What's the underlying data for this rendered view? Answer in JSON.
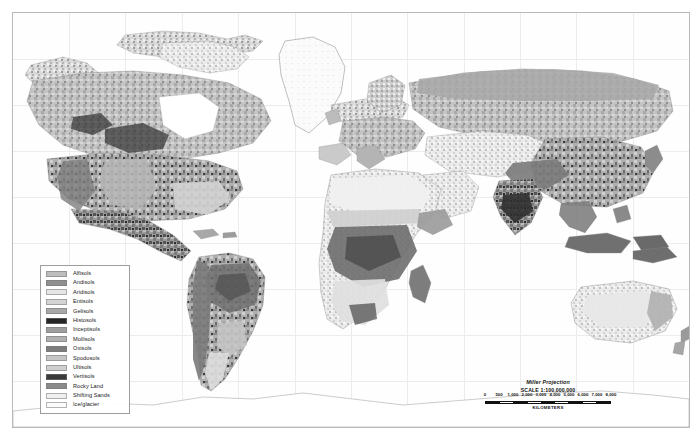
{
  "map": {
    "title": "World Soil Orders",
    "projection": "Miller Projection",
    "scale_ratio": "SCALE 1:100,000,000",
    "distance_units": "KILOMETERS",
    "graticule_visible": true,
    "ocean_color": "#ffffff",
    "frame_color": "#b9b9b9",
    "graticule_color": "#ececec"
  },
  "legend": {
    "title": "",
    "items": [
      {
        "label": "Alfisols",
        "color": "#bdbdbd"
      },
      {
        "label": "Andisols",
        "color": "#8f8f8f"
      },
      {
        "label": "Aridisols",
        "color": "#e6e6e6"
      },
      {
        "label": "Entisols",
        "color": "#d4d4d4"
      },
      {
        "label": "Gelisols",
        "color": "#a8a8a8"
      },
      {
        "label": "Histosols",
        "color": "#262626"
      },
      {
        "label": "Inceptisols",
        "color": "#9e9e9e"
      },
      {
        "label": "Mollisols",
        "color": "#b0b0b0"
      },
      {
        "label": "Oxisols",
        "color": "#7d7d7d"
      },
      {
        "label": "Spodosols",
        "color": "#c6c6c6"
      },
      {
        "label": "Ultisols",
        "color": "#cfcfcf"
      },
      {
        "label": "Vertisols",
        "color": "#3a3a3a"
      },
      {
        "label": "Rocky Land",
        "color": "#8a8a8a"
      },
      {
        "label": "Shifting Sands",
        "color": "#f0f0f0"
      },
      {
        "label": "Ice/glacier",
        "color": "#fbfbfb"
      }
    ]
  },
  "scalebar": {
    "ticks": [
      "0",
      "500",
      "1,000",
      "2,000",
      "3,000",
      "4,000",
      "5,000",
      "6,000",
      "7,000",
      "8,000"
    ],
    "segments": [
      "dark",
      "light",
      "dark",
      "light",
      "dark",
      "light",
      "dark",
      "light",
      "dark"
    ]
  }
}
